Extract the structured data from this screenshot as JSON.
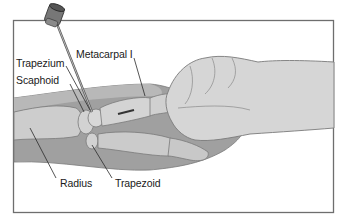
{
  "figure": {
    "labels": {
      "metacarpal": "Metacarpal I",
      "trapezium": "Trapezium",
      "scaphoid": "Scaphoid",
      "radius": "Radius",
      "trapezoid": "Trapezoid"
    },
    "colors": {
      "frame": "#6e6e6e",
      "skin_dark": "#9c9c9c",
      "skin_mid": "#b4b4b4",
      "bone": "#cfcfcf",
      "glove": "#d6d6d6",
      "outline": "#7a7a7a",
      "leader": "#2a2a2a"
    }
  }
}
